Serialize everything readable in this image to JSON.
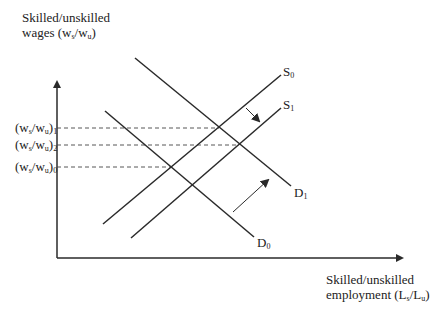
{
  "y_axis": {
    "label_line1": "Skilled/unskilled",
    "label_line2_prefix": "wages (w",
    "label_line2_sub1": "s",
    "label_line2_mid": "/w",
    "label_line2_sub2": "u",
    "label_line2_suffix": ")"
  },
  "x_axis": {
    "label_line1": "Skilled/unskilled",
    "label_line2_prefix": "employment (L",
    "label_line2_sub1": "s",
    "label_line2_mid": "/L",
    "label_line2_sub2": "u",
    "label_line2_suffix": ")"
  },
  "wage_levels": [
    {
      "pre": "(w",
      "s": "s",
      "mid": "/w",
      "u": "u",
      "post": ")",
      "idx": "1"
    },
    {
      "pre": "(w",
      "s": "s",
      "mid": "/w",
      "u": "u",
      "post": ")",
      "idx": "2"
    },
    {
      "pre": "(w",
      "s": "s",
      "mid": "/w",
      "u": "u",
      "post": ")",
      "idx": "0"
    }
  ],
  "curves": {
    "S0": {
      "letter": "S",
      "sub": "0"
    },
    "S1": {
      "letter": "S",
      "sub": "1"
    },
    "D0": {
      "letter": "D",
      "sub": "0"
    },
    "D1": {
      "letter": "D",
      "sub": "1"
    }
  },
  "colors": {
    "line": "#2a2a2a",
    "dash": "#444444",
    "background": "#ffffff"
  }
}
